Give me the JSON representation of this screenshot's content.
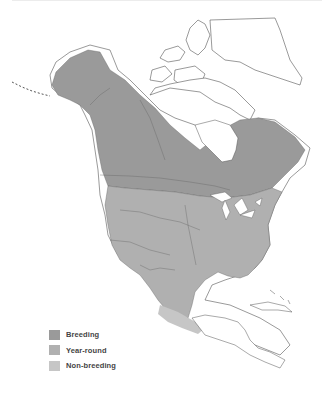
{
  "map": {
    "region": "North America",
    "colors": {
      "breeding": "#9a9a9a",
      "year_round": "#b0b0b0",
      "non_breeding": "#c6c6c6",
      "land": "#ffffff",
      "outline": "#555555"
    }
  },
  "legend": {
    "items": [
      {
        "label": "Breeding",
        "color": "#9a9a9a"
      },
      {
        "label": "Year-round",
        "color": "#b0b0b0"
      },
      {
        "label": "Non-breeding",
        "color": "#c6c6c6"
      }
    ]
  }
}
